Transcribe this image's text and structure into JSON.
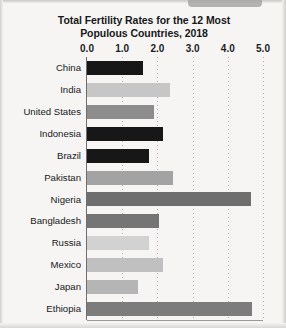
{
  "chart_data": {
    "type": "bar",
    "orientation": "horizontal",
    "title": "Total Fertility Rates for the 12 Most Populous Countries, 2018",
    "title_lines": [
      "Total Fertility Rates for the 12 Most",
      "Populous Countries, 2018"
    ],
    "xlabel": "",
    "ylabel": "",
    "xlim": [
      0.0,
      5.0
    ],
    "xticks": [
      "0.0",
      "1.0",
      "2.0",
      "3.0",
      "4.0",
      "5.0"
    ],
    "xtick_values": [
      0.0,
      1.0,
      2.0,
      3.0,
      4.0,
      5.0
    ],
    "grid": "vertical-dotted",
    "legend": "none",
    "categories": [
      "China",
      "India",
      "United States",
      "Indonesia",
      "Brazil",
      "Pakistan",
      "Nigeria",
      "Bangladesh",
      "Russia",
      "Mexico",
      "Japan",
      "Ethiopia"
    ],
    "values": [
      1.6,
      2.35,
      1.9,
      2.15,
      1.75,
      2.45,
      4.65,
      2.05,
      1.75,
      2.15,
      1.45,
      4.7
    ],
    "bar_colors": [
      "#171717",
      "#c6c6c6",
      "#8d8d8d",
      "#171717",
      "#171717",
      "#a3a3a3",
      "#6e6e6e",
      "#757575",
      "#d2d2d2",
      "#c0c0c0",
      "#b5b5b5",
      "#7c7c7c"
    ]
  },
  "style": {
    "page_background": "#f6f5f3",
    "axis_color": "#6e6e6e",
    "grid_color": "#b4b2af",
    "text_color": "#17191b"
  }
}
